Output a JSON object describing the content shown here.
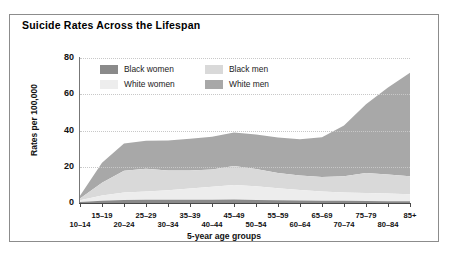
{
  "chart_title": "Suicide Rates Across the Lifespan",
  "legend": {
    "items": [
      {
        "label": "Black women",
        "color": "#8a8a8a"
      },
      {
        "label": "Black men",
        "color": "#d9d9d9"
      },
      {
        "label": "White women",
        "color": "#ededed"
      },
      {
        "label": "White men",
        "color": "#a8a8a8"
      }
    ]
  },
  "chart_data": {
    "type": "area",
    "stacked": true,
    "title": "Suicide Rates Across the Lifespan",
    "xlabel": "5-year age groups",
    "ylabel": "Rates per 100,000",
    "ylim": [
      0,
      80
    ],
    "yticks": [
      0,
      20,
      40,
      60,
      80
    ],
    "grid": true,
    "legend_position": "top-left-inside",
    "categories": [
      "10–14",
      "15–19",
      "20–24",
      "25–29",
      "30–34",
      "35–39",
      "40–44",
      "45–49",
      "50–54",
      "55–59",
      "60–64",
      "65–69",
      "70–74",
      "75–79",
      "80–84",
      "85+"
    ],
    "series": [
      {
        "name": "Black women",
        "color": "#8a8a8a",
        "values": [
          0.5,
          1.2,
          1.6,
          1.8,
          1.8,
          1.8,
          1.8,
          1.9,
          1.7,
          1.5,
          1.4,
          1.3,
          1.2,
          1.1,
          1.0,
          1.0
        ]
      },
      {
        "name": "White women",
        "color": "#ededed",
        "values": [
          1.0,
          3.0,
          4.2,
          4.6,
          5.2,
          6.2,
          7.2,
          8.0,
          7.6,
          6.6,
          5.8,
          5.0,
          4.6,
          4.4,
          4.2,
          3.8
        ]
      },
      {
        "name": "Black men",
        "color": "#d9d9d9",
        "values": [
          1.0,
          7.0,
          12.0,
          12.5,
          11.0,
          10.0,
          9.5,
          10.5,
          9.5,
          8.5,
          8.0,
          8.0,
          9.0,
          11.0,
          10.5,
          10.0
        ]
      },
      {
        "name": "White men",
        "color": "#a8a8a8",
        "values": [
          1.5,
          11.0,
          15.0,
          15.5,
          16.5,
          17.5,
          18.0,
          18.5,
          19.0,
          19.5,
          20.0,
          22.0,
          28.0,
          38.0,
          48.0,
          57.0
        ]
      }
    ]
  }
}
